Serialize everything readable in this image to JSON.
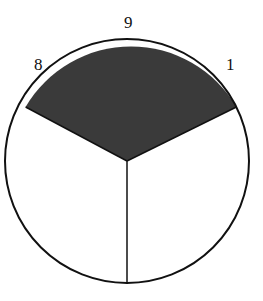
{
  "diagram": {
    "type": "spinner",
    "sectors": 3,
    "shaded_sector_color": "#3a3a3a",
    "outline_color": "#111111",
    "labels": [
      {
        "text": "8",
        "position": "upper-left"
      },
      {
        "text": "9",
        "position": "top"
      },
      {
        "text": "1",
        "position": "upper-right"
      }
    ]
  }
}
